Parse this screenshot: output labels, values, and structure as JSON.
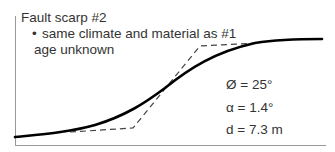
{
  "figure": {
    "title": "Fault scarp #2",
    "bullet_marker": "•",
    "bullet_text": "same climate and material as #1",
    "age_text": "age unknown",
    "parameters": [
      {
        "symbol": "Ø",
        "label": "Ø = 25°"
      },
      {
        "symbol": "α",
        "label": "α = 1.4°"
      },
      {
        "symbol": "d",
        "label": "d = 7.3 m"
      }
    ],
    "colors": {
      "profile_line": "#000000",
      "dashed_line": "#444444",
      "axis": "#999999",
      "text": "#333333"
    },
    "profile_curve": {
      "style": "solid",
      "description": "degraded scarp profile (smooth sigmoid)"
    },
    "initial_scarp": {
      "style": "dashed",
      "description": "original fault scarp geometry"
    }
  }
}
